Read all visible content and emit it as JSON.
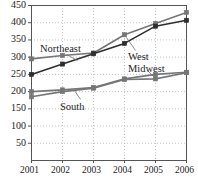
{
  "chart_data": {
    "type": "line",
    "title": "",
    "xlabel": "",
    "ylabel": "",
    "categories": [
      "2001",
      "2002",
      "2003",
      "2004",
      "2005",
      "2006"
    ],
    "x": [
      2001,
      2002,
      2003,
      2004,
      2005,
      2006
    ],
    "ylim": [
      0,
      450
    ],
    "yticks": [
      50,
      100,
      150,
      200,
      250,
      300,
      350,
      400,
      450
    ],
    "ytick_labels": [
      "50",
      "100",
      "150",
      "200",
      "250",
      "300",
      "350",
      "400",
      "450"
    ],
    "xtick_labels": [
      "2001",
      "2002",
      "2003",
      "2004",
      "2005",
      "2006"
    ],
    "grid": true,
    "grid_style": "dotted",
    "legend": "inline-annotations",
    "marker": "square",
    "series": [
      {
        "name": "Northeast",
        "color": "#767676",
        "values": [
          295,
          305,
          312,
          365,
          398,
          430
        ]
      },
      {
        "name": "West",
        "color": "#2e2e2e",
        "values": [
          250,
          280,
          310,
          340,
          390,
          407
        ]
      },
      {
        "name": "Midwest",
        "color": "#767676",
        "values": [
          200,
          205,
          212,
          237,
          250,
          256
        ]
      },
      {
        "name": "South",
        "color": "#767676",
        "values": [
          185,
          200,
          210,
          235,
          237,
          255
        ]
      }
    ],
    "annotations": [
      {
        "text": "Northeast",
        "series": "Northeast",
        "x": 40,
        "y": 44
      },
      {
        "text": "West",
        "series": "West",
        "x": 128,
        "y": 52
      },
      {
        "text": "Midwest",
        "series": "Midwest",
        "x": 128,
        "y": 64
      },
      {
        "text": "South",
        "series": "South",
        "x": 60,
        "y": 102
      }
    ]
  },
  "colors": {
    "axis": "#555555",
    "grid": "#aaaaaa",
    "text": "#1d1d1d",
    "series_gray": "#767676",
    "series_dark": "#2e2e2e",
    "background": "#ffffff"
  }
}
